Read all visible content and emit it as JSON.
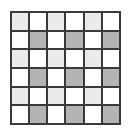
{
  "grid": {
    "rows": 6,
    "cols": 6,
    "colors": {
      "white": "#ffffff",
      "light": "#ebebeb",
      "dark": "#b4b4b4",
      "line": "#3a3a3a"
    },
    "cells": [
      [
        "light",
        "white",
        "light",
        "white",
        "light",
        "white"
      ],
      [
        "white",
        "dark",
        "white",
        "dark",
        "white",
        "dark"
      ],
      [
        "light",
        "white",
        "light",
        "white",
        "light",
        "white"
      ],
      [
        "white",
        "dark",
        "white",
        "dark",
        "white",
        "dark"
      ],
      [
        "light",
        "white",
        "light",
        "white",
        "light",
        "white"
      ],
      [
        "white",
        "dark",
        "white",
        "dark",
        "white",
        "dark"
      ]
    ]
  }
}
